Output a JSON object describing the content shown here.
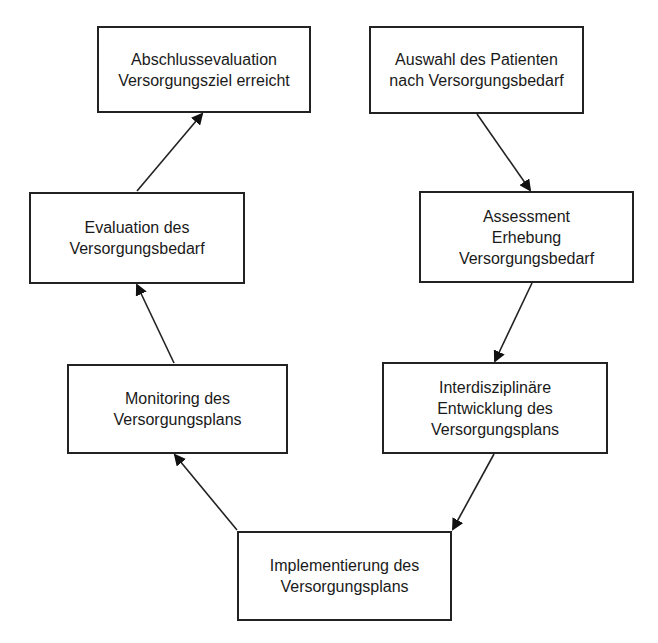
{
  "diagram": {
    "type": "cycle-flowchart",
    "boxes": [
      {
        "id": "abschluss",
        "lines": [
          "Abschlussevaluation",
          "Versorgungsziel erreicht"
        ]
      },
      {
        "id": "auswahl",
        "lines": [
          "Auswahl des Patienten",
          "nach Versorgungsbedarf"
        ]
      },
      {
        "id": "evaluation",
        "lines": [
          "Evaluation des",
          "Versorgungsbedarf"
        ]
      },
      {
        "id": "assessment",
        "lines": [
          "Assessment",
          "Erhebung",
          "Versorgungsbedarf"
        ]
      },
      {
        "id": "monitoring",
        "lines": [
          "Monitoring des",
          "Versorgungsplans"
        ]
      },
      {
        "id": "entwicklung",
        "lines": [
          "Interdisziplinäre",
          "Entwicklung des",
          "Versorgungsplans"
        ]
      },
      {
        "id": "implementierung",
        "lines": [
          "Implementierung des",
          "Versorgungsplans"
        ]
      }
    ],
    "edges": [
      {
        "from": "auswahl",
        "to": "assessment"
      },
      {
        "from": "assessment",
        "to": "entwicklung"
      },
      {
        "from": "entwicklung",
        "to": "implementierung"
      },
      {
        "from": "implementierung",
        "to": "monitoring"
      },
      {
        "from": "monitoring",
        "to": "evaluation"
      },
      {
        "from": "evaluation",
        "to": "abschluss"
      }
    ],
    "colors": {
      "stroke": "#222222",
      "background": "#ffffff",
      "text": "#1a1a1a"
    }
  }
}
